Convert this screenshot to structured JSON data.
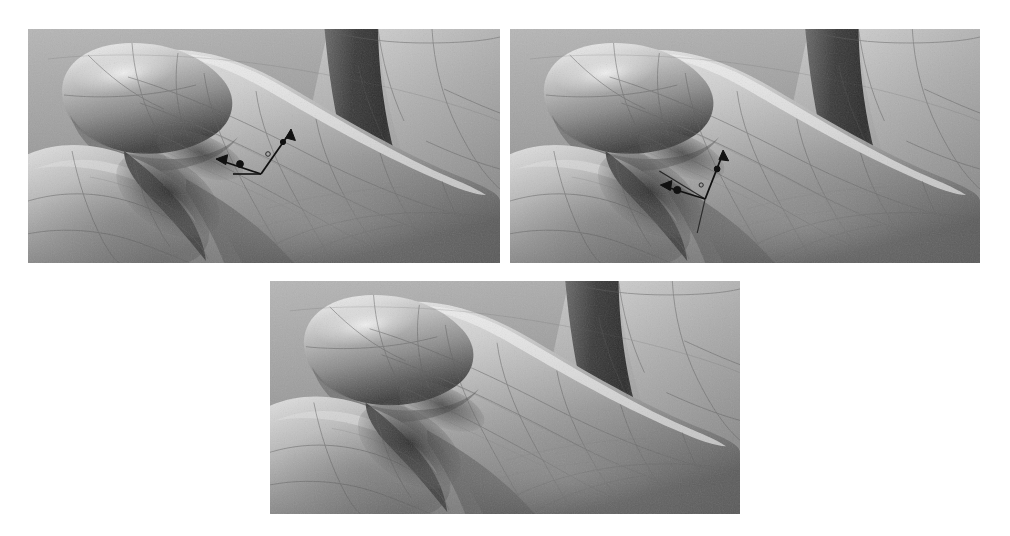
{
  "figure": {
    "title": "",
    "background_color": "#ffffff",
    "width": 1010,
    "height": 536,
    "render_style": "grayscale smooth-shaded NURBS surface with patch boundary curves",
    "panel_count": 3,
    "layout": "two panels on top row, one centered panel on bottom row"
  },
  "palette": {
    "background": "#ffffff",
    "highlight": "#e9e9e9",
    "light": "#d2d2d2",
    "midtone": "#9b9b9b",
    "shade": "#6f6f6f",
    "deep_shade": "#4a4a4a",
    "shadow": "#2d2d2d",
    "patch_line": "#5f5f5f",
    "annotation": "#111111"
  },
  "panels": [
    {
      "id": "panel-a",
      "label": "",
      "position": "top-left",
      "x": 28,
      "y": 29,
      "w": 472,
      "h": 234,
      "has_annotation": true,
      "annotation": {
        "name": "axis-frame-marker",
        "description": "L-shaped two-arrow frame with node dots marking a surface point",
        "vertex": {
          "x": 233,
          "y": 145
        },
        "arrows": [
          {
            "name": "arrow-up-right",
            "dx": 30,
            "dy": -43,
            "head": "filled"
          },
          {
            "name": "arrow-left",
            "dx": -45,
            "dy": -14,
            "head": "filled"
          }
        ],
        "nodes": [
          {
            "name": "node-dot-1",
            "x": 212,
            "y": 135,
            "r": 3.2
          },
          {
            "name": "node-dot-2",
            "x": 247,
            "y": 122,
            "r": 2.6
          }
        ],
        "open_point": {
          "name": "open-circle-marker",
          "x": 240,
          "y": 125,
          "r": 2.2
        }
      }
    },
    {
      "id": "panel-b",
      "label": "",
      "position": "top-right",
      "x": 510,
      "y": 29,
      "w": 470,
      "h": 234,
      "has_annotation": true,
      "annotation": {
        "name": "axis-frame-marker",
        "description": "L-shaped two-arrow frame with node dots in the thumb-finger crease",
        "vertex": {
          "x": 703,
          "y": 172
        },
        "arrows": [
          {
            "name": "arrow-up-right",
            "dx": 18,
            "dy": -48,
            "head": "filled"
          },
          {
            "name": "arrow-left",
            "dx": -46,
            "dy": -13,
            "head": "filled"
          }
        ],
        "nodes": [
          {
            "name": "node-dot-1",
            "x": 674,
            "y": 164,
            "r": 3.4
          },
          {
            "name": "node-dot-2",
            "x": 716,
            "y": 153,
            "r": 2.8
          }
        ],
        "open_point": {
          "name": "open-circle-marker",
          "x": 698,
          "y": 158,
          "r": 2.0
        }
      }
    },
    {
      "id": "panel-c",
      "label": "",
      "position": "bottom-center",
      "x": 270,
      "y": 281,
      "w": 470,
      "h": 233,
      "has_annotation": false,
      "annotation": null
    }
  ],
  "geometry": {
    "description": "Close-up of index finger crossing over the thumb base; a second finger column recedes at upper right; patch seam curves run across the skin surface.",
    "features": [
      {
        "name": "finger-tip-lobe",
        "note": "rounded fingertip at upper-left, strong specular highlight on top"
      },
      {
        "name": "finger-shaft",
        "note": "long cylindrical shaft sweeping down-right across the frame"
      },
      {
        "name": "thumb-base-lobe",
        "note": "lower-left rounded mass under the finger"
      },
      {
        "name": "interdigital-crease",
        "note": "dark concave valley where finger meets thumb"
      },
      {
        "name": "background-finger-column",
        "note": "vertical darker finger silhouette at upper right"
      },
      {
        "name": "palm-plane",
        "note": "broad lighter plane filling the lower-right of each frame"
      }
    ]
  }
}
